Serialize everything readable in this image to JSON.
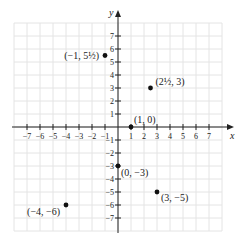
{
  "chart_data": {
    "type": "scatter",
    "title": "",
    "xlabel": "x",
    "ylabel": "y",
    "xlim": [
      -8,
      8
    ],
    "ylim": [
      -8,
      8
    ],
    "grid": true,
    "x_ticks": [
      -7,
      -6,
      -5,
      -4,
      -3,
      -2,
      -1,
      1,
      2,
      3,
      4,
      5,
      6,
      7
    ],
    "y_ticks": [
      -7,
      -6,
      -5,
      -4,
      -3,
      -2,
      -1,
      1,
      2,
      3,
      4,
      5,
      6,
      7
    ],
    "x_tick_labels": [
      "−7",
      "−6",
      "−5",
      "−4",
      "−3",
      "−2",
      "−1",
      "1",
      "2",
      "3",
      "4",
      "5",
      "6",
      "7"
    ],
    "y_tick_labels": [
      "−7",
      "−6",
      "−5",
      "−4",
      "−3",
      "−2",
      "−1",
      "1",
      "2",
      "3",
      "4",
      "5",
      "6",
      "7"
    ],
    "points": [
      {
        "x": -1,
        "y": 5.5,
        "label": "(−1, 5½)"
      },
      {
        "x": 2.5,
        "y": 3,
        "label": "(2½, 3)"
      },
      {
        "x": 1,
        "y": 0,
        "label": "(1, 0)"
      },
      {
        "x": 0,
        "y": -3,
        "label": "(0, −3)"
      },
      {
        "x": 3,
        "y": -5,
        "label": "(3, −5)"
      },
      {
        "x": -4,
        "y": -6,
        "label": "(−4, −6)"
      }
    ]
  },
  "axes": {
    "x_label": "x",
    "y_label": "y"
  },
  "colors": {
    "grid": "#e4e4e4",
    "axis": "#222222",
    "point": "#111111"
  }
}
